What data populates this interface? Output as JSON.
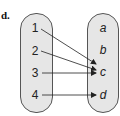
{
  "part_label": "d.",
  "domain_set": [
    "1",
    "2",
    "3",
    "4"
  ],
  "range_set": [
    "a",
    "b",
    "c",
    "d"
  ],
  "mapping": [
    {
      "from": "1",
      "to": "c"
    },
    {
      "from": "2",
      "to": "c"
    },
    {
      "from": "3",
      "to": "c"
    },
    {
      "from": "4",
      "to": "d"
    }
  ],
  "colors": {
    "oval_fill": "#e6e6e6",
    "oval_stroke": "#555555",
    "arrow": "#222222"
  }
}
